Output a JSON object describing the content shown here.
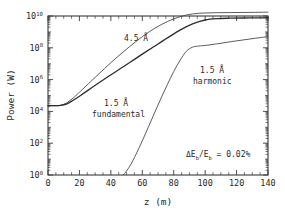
{
  "chart_data": {
    "type": "line",
    "title": "",
    "xlabel": "z  (m)",
    "ylabel": "Power  (W)",
    "xlim": [
      0,
      140
    ],
    "ylim": [
      1,
      10000000000
    ],
    "yscale": "log",
    "xscale": "linear",
    "grid": false,
    "legend": "none (inline curve annotations)",
    "xticks": [
      0,
      20,
      40,
      60,
      80,
      100,
      120,
      140
    ],
    "xtick_labels": [
      "0",
      "20",
      "40",
      "60",
      "80",
      "100",
      "120",
      "140"
    ],
    "yticks": [
      1,
      100,
      10000,
      1000000,
      100000000,
      10000000000
    ],
    "ytick_labels": [
      "10^0",
      "10^2",
      "10^4",
      "10^6",
      "10^8",
      "10^10"
    ],
    "ytick_mantissa": "10",
    "ytick_exponents": [
      "0",
      "2",
      "4",
      "6",
      "8",
      "10"
    ],
    "series": [
      {
        "name": "4.5 A",
        "label": "4.5 Å",
        "x": [
          0,
          4,
          8,
          12,
          16,
          20,
          28,
          36,
          44,
          52,
          60,
          68,
          76,
          84,
          92,
          100,
          108,
          116,
          124,
          132,
          140
        ],
        "y": [
          23000.0,
          23000.0,
          24000.0,
          35000.0,
          70000.0,
          160000.0,
          900000.0,
          5000000.0,
          26000000.0,
          120000000.0,
          500000000.0,
          1700000000.0,
          4500000000.0,
          9000000000.0,
          13500000000.0,
          15500000000.0,
          16200000000.0,
          16500000000.0,
          16700000000.0,
          17000000000.0,
          17500000000.0
        ]
      },
      {
        "name": "1.5 A fundamental",
        "label": "1.5 Å fundamental",
        "x": [
          0,
          4,
          8,
          12,
          16,
          20,
          28,
          36,
          44,
          52,
          60,
          68,
          76,
          84,
          92,
          100,
          108,
          116,
          124,
          132,
          140
        ],
        "y": [
          23000.0,
          23000.0,
          24000.0,
          30000.0,
          50000.0,
          90000.0,
          320000.0,
          1100000.0,
          3600000.0,
          12000000.0,
          40000000.0,
          130000000.0,
          420000000.0,
          1300000000.0,
          3200000000.0,
          5600000000.0,
          6900000000.0,
          7300000000.0,
          7500000000.0,
          7600000000.0,
          7800000000.0
        ]
      },
      {
        "name": "1.5 A harmonic",
        "label": "1.5 Å harmonic",
        "x": [
          48,
          52,
          56,
          60,
          64,
          68,
          72,
          76,
          80,
          84,
          88,
          92,
          96,
          100,
          108,
          116,
          124,
          132,
          140
        ],
        "y": [
          1.0,
          3.5,
          20.0,
          140.0,
          1100.0,
          9000.0,
          70000.0,
          500000.0,
          3200000.0,
          16000000.0,
          60000000.0,
          110000000.0,
          130000000.0,
          140000000.0,
          180000000.0,
          240000000.0,
          310000000.0,
          400000000.0,
          500000000.0
        ]
      }
    ],
    "annotations": [
      {
        "name": "curve-label-45a",
        "text": "4.5 Å",
        "x": 48,
        "y": 2000000000.0
      },
      {
        "name": "curve-label-15a-fundamental-line1",
        "text": "1.5 Å",
        "x": 52,
        "y": 180000.0
      },
      {
        "name": "curve-label-15a-fundamental-line2",
        "text": "fundamental",
        "x": 50,
        "y": 30000.0
      },
      {
        "name": "curve-label-15a-harmonic-line1",
        "text": "1.5 Å",
        "x": 104,
        "y": 22000000.0
      },
      {
        "name": "curve-label-15a-harmonic-line2",
        "text": "harmonic",
        "x": 102,
        "y": 3500000.0
      },
      {
        "name": "energy-spread-annotation",
        "x": 108,
        "y": 20.0
      }
    ],
    "energy_spread": {
      "delta": "ΔE",
      "sub1": "b",
      "slash": "/E",
      "sub2": "b",
      "equals": " = 0.02%"
    }
  },
  "colors": {
    "background": "#ffffff",
    "axis": "#3a3a3a",
    "curve": "#4a4a4a",
    "curve_bold": "#2e2e2e",
    "text": "#2a2a2a"
  }
}
